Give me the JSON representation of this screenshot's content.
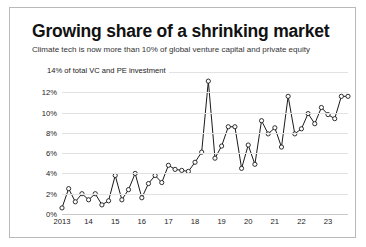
{
  "header": {
    "title": "Growing share of a shrinking market",
    "subtitle": "Climate tech is now more than 10% of global venture capital and private equity"
  },
  "chart_data": {
    "type": "line",
    "title": "Growing share of a shrinking market",
    "subtitle": "Climate tech is now more than 10% of global venture capital and private equity",
    "axis_note": "14% of total VC and PE investment",
    "xlabel": "",
    "ylabel": "% of total VC and PE investment",
    "ylim": [
      0,
      14
    ],
    "yticks": [
      0,
      2,
      4,
      6,
      8,
      10,
      12,
      14
    ],
    "ytick_labels": [
      "0%",
      "2%",
      "4%",
      "6%",
      "8%",
      "10%",
      "12%",
      "14%"
    ],
    "grid": true,
    "legend": "none",
    "markers": "open-circle",
    "frequency": "quarterly",
    "xtick_labels": [
      "2013",
      "14",
      "15",
      "16",
      "17",
      "18",
      "19",
      "20",
      "21",
      "22",
      "23"
    ],
    "xtick_positions": [
      0,
      4,
      8,
      12,
      16,
      20,
      24,
      28,
      32,
      36,
      40
    ],
    "x": [
      "2013 Q1",
      "2013 Q2",
      "2013 Q3",
      "2013 Q4",
      "2014 Q1",
      "2014 Q2",
      "2014 Q3",
      "2014 Q4",
      "2015 Q1",
      "2015 Q2",
      "2015 Q3",
      "2015 Q4",
      "2016 Q1",
      "2016 Q2",
      "2016 Q3",
      "2016 Q4",
      "2017 Q1",
      "2017 Q2",
      "2017 Q3",
      "2017 Q4",
      "2018 Q1",
      "2018 Q2",
      "2018 Q3",
      "2018 Q4",
      "2019 Q1",
      "2019 Q2",
      "2019 Q3",
      "2019 Q4",
      "2020 Q1",
      "2020 Q2",
      "2020 Q3",
      "2020 Q4",
      "2021 Q1",
      "2021 Q2",
      "2021 Q3",
      "2021 Q4",
      "2022 Q1",
      "2022 Q2",
      "2022 Q3",
      "2022 Q4",
      "2023 Q1",
      "2023 Q2",
      "2023 Q3",
      "2023 Q4"
    ],
    "values": [
      0.6,
      2.5,
      1.2,
      2.0,
      1.4,
      2.0,
      0.9,
      1.3,
      3.8,
      1.4,
      2.4,
      4.0,
      1.6,
      3.0,
      3.8,
      3.1,
      4.8,
      4.4,
      4.3,
      4.2,
      5.1,
      6.1,
      13.1,
      5.5,
      6.7,
      8.6,
      8.6,
      4.5,
      6.8,
      4.9,
      9.2,
      7.9,
      8.5,
      6.6,
      11.6,
      7.9,
      8.4,
      9.9,
      8.9,
      10.5,
      9.8,
      9.4,
      11.6,
      11.6
    ],
    "units": "percent",
    "color": "#1a1a1a"
  }
}
